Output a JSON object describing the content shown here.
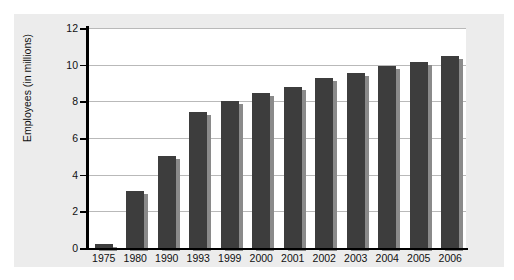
{
  "chart_data": {
    "type": "bar",
    "title": "",
    "subtitle": "",
    "xlabel": "",
    "ylabel": "Employees (in millions)",
    "categories": [
      "1975",
      "1980",
      "1990",
      "1993",
      "1999",
      "2000",
      "2001",
      "2002",
      "2003",
      "2004",
      "2005",
      "2006"
    ],
    "values": [
      0.2,
      3.1,
      5.0,
      7.4,
      8.0,
      8.45,
      8.8,
      9.25,
      9.55,
      9.95,
      10.15,
      10.5
    ],
    "series": [
      {
        "name": "Employees",
        "values": [
          0.2,
          3.1,
          5.0,
          7.4,
          8.0,
          8.45,
          8.8,
          9.25,
          9.55,
          9.95,
          10.15,
          10.5
        ]
      }
    ],
    "ylim": [
      0,
      12
    ],
    "yticks": [
      0,
      2,
      4,
      6,
      8,
      10,
      12
    ],
    "ytick_labels": [
      "0",
      "2",
      "4",
      "6",
      "8",
      "10",
      "12"
    ],
    "grid": true,
    "grid_axis": "y",
    "legend": false,
    "legend_position": "none",
    "bar_color": "#3d3d3d",
    "bar_shadow_color": "#8a8a8a",
    "gridline_color": "#b9b9b9",
    "axis_color": "#000000",
    "plot_background": "#ffffff",
    "figure_background": "#ececec",
    "annotations": []
  }
}
